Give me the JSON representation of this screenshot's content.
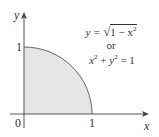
{
  "diagram": {
    "type": "quarter-circle-region",
    "colors": {
      "fill": "#e6e6e6",
      "stroke": "#555555",
      "axis": "#444444",
      "text": "#333333"
    },
    "axes": {
      "x_label": "x",
      "y_label": "y",
      "origin_label": "0",
      "x_tick_label": "1",
      "y_tick_label": "1"
    },
    "equation": {
      "line1_lhs": "y = ",
      "line1_sqrt_body": "1 − x",
      "line1_exp": "2",
      "line2": "or",
      "line3_x": "x",
      "line3_x_exp": "2",
      "line3_plus": " + ",
      "line3_y": "y",
      "line3_y_exp": "2",
      "line3_rhs": " = 1"
    }
  }
}
